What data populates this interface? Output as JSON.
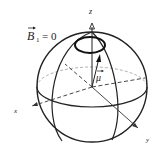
{
  "diagram": {
    "field_label": "B",
    "field_subscript": "1",
    "field_value": "= 0",
    "moment_label": "μ",
    "axes": {
      "z": "z",
      "x": "x",
      "y": "y"
    },
    "colors": {
      "line": "#222222",
      "background": "#ffffff"
    }
  }
}
